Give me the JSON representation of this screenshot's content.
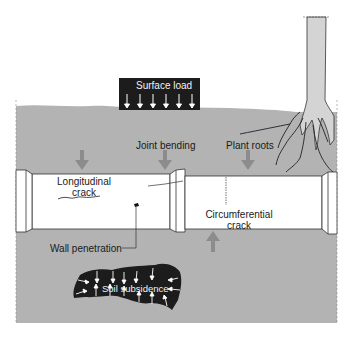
{
  "diagram": {
    "title": "",
    "labels": {
      "surface_load": "Surface load",
      "joint_bending": "Joint bending",
      "plant_roots": "Plant roots",
      "longitudinal_crack_line1": "Longitudinal",
      "longitudinal_crack_line2": "crack",
      "wall_penetration": "Wall penetration",
      "circumferential_crack_line1": "Circumferential",
      "circumferential_crack_line2": "crack",
      "soil_subsidence": "Soil subsidence"
    },
    "elements": [
      {
        "id": "soil",
        "type": "region",
        "color": "#b3b3b3"
      },
      {
        "id": "surface-load",
        "type": "load-block",
        "arrows": 6,
        "color": "#1c1c1c"
      },
      {
        "id": "pipe-left",
        "type": "pipe-segment"
      },
      {
        "id": "pipe-joint",
        "type": "pipe-joint"
      },
      {
        "id": "pipe-right",
        "type": "pipe-segment"
      },
      {
        "id": "tree",
        "type": "tree-with-roots"
      },
      {
        "id": "soil-void",
        "type": "void",
        "color": "#1c1c1c"
      }
    ],
    "force_arrows": [
      {
        "label": "downward-load",
        "direction": "down",
        "count": 3
      },
      {
        "label": "upward-force",
        "direction": "up",
        "count": 1
      }
    ],
    "colors": {
      "soil": "#b3b3b3",
      "pipe": "#ffffff",
      "outline": "#333333",
      "dark_block": "#1c1c1c",
      "force_arrow": "#8c8c8c",
      "trunk": "#d4d4d4"
    }
  }
}
